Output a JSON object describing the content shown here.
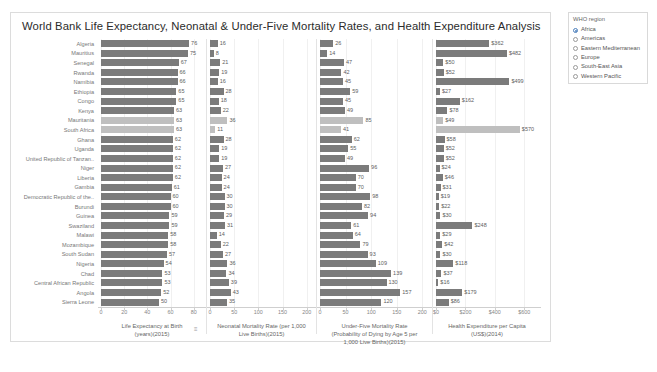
{
  "dashboard": {
    "title": "World Bank Life Expectancy, Neonatal & Under-Five Mortality Rates, and Health Expenditure Analysis"
  },
  "legend": {
    "title": "WHO region",
    "items": [
      {
        "label": "Africa",
        "selected": true
      },
      {
        "label": "Americas",
        "selected": false
      },
      {
        "label": "Eastern Mediterranean",
        "selected": false
      },
      {
        "label": "Europe",
        "selected": false
      },
      {
        "label": "South-East Asia",
        "selected": false
      },
      {
        "label": "Western Pacific",
        "selected": false
      }
    ]
  },
  "countries": [
    "Algeria",
    "Mauritius",
    "Senegal",
    "Rwanda",
    "Namibia",
    "Ethiopia",
    "Congo",
    "Kenya",
    "Mauritania",
    "South Africa",
    "Ghana",
    "Uganda",
    "United Republic of Tanzan..",
    "Niger",
    "Liberia",
    "Gambia",
    "Democratic Republic of the..",
    "Burundi",
    "Guinea",
    "Swaziland",
    "Malawi",
    "Mozambique",
    "South Sudan",
    "Nigeria",
    "Chad",
    "Central African Republic",
    "Angola",
    "Sierra Leone"
  ],
  "highlighted_rows": [
    8,
    9
  ],
  "chart_data": [
    {
      "type": "bar",
      "orientation": "horizontal",
      "title": "Life Expectancy at Birth (years)(2015)",
      "xlabel": "Life Expectancy at Birth (years)(2015)",
      "caption_lines": [
        "Life Expectancy at Birth",
        "(years)(2015)"
      ],
      "ylabel": "",
      "categories": [
        "Algeria",
        "Mauritius",
        "Senegal",
        "Rwanda",
        "Namibia",
        "Ethiopia",
        "Congo",
        "Kenya",
        "Mauritania",
        "South Africa",
        "Ghana",
        "Uganda",
        "United Republic of Tanzan..",
        "Niger",
        "Liberia",
        "Gambia",
        "Democratic Republic of the..",
        "Burundi",
        "Guinea",
        "Swaziland",
        "Malawi",
        "Mozambique",
        "South Sudan",
        "Nigeria",
        "Chad",
        "Central African Republic",
        "Angola",
        "Sierra Leone"
      ],
      "values": [
        76,
        75,
        67,
        66,
        66,
        65,
        65,
        63,
        63,
        63,
        62,
        62,
        62,
        62,
        62,
        61,
        60,
        60,
        59,
        59,
        58,
        58,
        57,
        54,
        53,
        53,
        52,
        50
      ],
      "ticks": [
        0,
        20,
        40,
        60,
        80
      ],
      "tick_labels": [
        "0",
        "20",
        "40",
        "60",
        "80"
      ],
      "xlim": [
        0,
        88
      ],
      "grid": true
    },
    {
      "type": "bar",
      "orientation": "horizontal",
      "title": "Neonatal Mortality Rate (per 1,000 Live Births)(2015)",
      "xlabel": "Neonatal Mortality Rate (per 1,000 Live Births)(2015)",
      "caption_lines": [
        "Neonatal Mortality Rate (per 1,000",
        "Live Births)(2015)"
      ],
      "ylabel": "",
      "categories": [
        "Algeria",
        "Mauritius",
        "Senegal",
        "Rwanda",
        "Namibia",
        "Ethiopia",
        "Congo",
        "Kenya",
        "Mauritania",
        "South Africa",
        "Ghana",
        "Uganda",
        "United Republic of Tanzan..",
        "Niger",
        "Liberia",
        "Gambia",
        "Democratic Republic of the..",
        "Burundi",
        "Guinea",
        "Swaziland",
        "Malawi",
        "Mozambique",
        "South Sudan",
        "Nigeria",
        "Chad",
        "Central African Republic",
        "Angola",
        "Sierra Leone"
      ],
      "values": [
        16,
        8,
        21,
        19,
        16,
        28,
        18,
        22,
        36,
        11,
        28,
        19,
        19,
        27,
        24,
        24,
        30,
        30,
        29,
        31,
        14,
        22,
        27,
        36,
        34,
        39,
        43,
        35
      ],
      "ticks": [
        0,
        50,
        100,
        150,
        200
      ],
      "tick_labels": [
        "0",
        "50",
        "100",
        "150",
        "200"
      ],
      "xlim": [
        0,
        215
      ],
      "grid": true
    },
    {
      "type": "bar",
      "orientation": "horizontal",
      "title": "Under-Five Mortality Rate (Probability of Dying by Age 5 per 1,000 Live Births)(2015)",
      "xlabel": "Under-Five Mortality Rate (Probability of Dying by Age 5 per 1,000 Live Births)(2015)",
      "caption_lines": [
        "Under-Five Mortality Rate",
        "(Probability of Dying by Age 5 per",
        "1,000 Live Births)(2015)"
      ],
      "ylabel": "",
      "categories": [
        "Algeria",
        "Mauritius",
        "Senegal",
        "Rwanda",
        "Namibia",
        "Ethiopia",
        "Congo",
        "Kenya",
        "Mauritania",
        "South Africa",
        "Ghana",
        "Uganda",
        "United Republic of Tanzan..",
        "Niger",
        "Liberia",
        "Gambia",
        "Democratic Republic of the..",
        "Burundi",
        "Guinea",
        "Swaziland",
        "Malawi",
        "Mozambique",
        "South Sudan",
        "Nigeria",
        "Chad",
        "Central African Republic",
        "Angola",
        "Sierra Leone"
      ],
      "values": [
        26,
        14,
        47,
        42,
        45,
        59,
        45,
        49,
        85,
        41,
        62,
        55,
        49,
        96,
        70,
        70,
        98,
        82,
        94,
        61,
        64,
        79,
        93,
        109,
        139,
        130,
        157,
        120
      ],
      "ticks": [
        0,
        50,
        100,
        150,
        200
      ],
      "tick_labels": [
        "0",
        "50",
        "100",
        "150",
        "200"
      ],
      "xlim": [
        0,
        215
      ],
      "grid": true
    },
    {
      "type": "bar",
      "orientation": "horizontal",
      "title": "Health Expenditure per Capita (US$)(2014)",
      "xlabel": "Health Expenditure per Capita (US$)(2014)",
      "caption_lines": [
        "Health Expenditure per Capita",
        "(US$)(2014)"
      ],
      "ylabel": "",
      "categories": [
        "Algeria",
        "Mauritius",
        "Senegal",
        "Rwanda",
        "Namibia",
        "Ethiopia",
        "Congo",
        "Kenya",
        "Mauritania",
        "South Africa",
        "Ghana",
        "Uganda",
        "United Republic of Tanzan..",
        "Niger",
        "Liberia",
        "Gambia",
        "Democratic Republic of the..",
        "Burundi",
        "Guinea",
        "Swaziland",
        "Malawi",
        "Mozambique",
        "South Sudan",
        "Nigeria",
        "Chad",
        "Central African Republic",
        "Angola",
        "Sierra Leone"
      ],
      "values": [
        362,
        482,
        50,
        52,
        499,
        27,
        162,
        78,
        49,
        570,
        58,
        52,
        52,
        24,
        46,
        31,
        19,
        22,
        30,
        248,
        29,
        42,
        30,
        118,
        37,
        16,
        179,
        86
      ],
      "value_labels": [
        "$362",
        "$482",
        "$50",
        "$52",
        "$499",
        "$27",
        "$162",
        "$78",
        "$49",
        "$570",
        "$58",
        "$52",
        "$52",
        "$24",
        "$46",
        "$31",
        "$19",
        "$22",
        "$30",
        "$248",
        "$29",
        "$42",
        "$30",
        "$118",
        "$37",
        "$16",
        "$179",
        "$86"
      ],
      "ticks": [
        0,
        200,
        400,
        600
      ],
      "tick_labels": [
        "$0",
        "$200",
        "$400",
        "$600"
      ],
      "xlim": [
        0,
        700
      ],
      "grid": true
    }
  ],
  "colors": {
    "bar": "#7b7b7b",
    "bar_highlight": "#bfbfbf",
    "accent": "#4a7ebb",
    "grid": "#f0f0f0",
    "axis": "#cfcfcf",
    "text": "#5e5e5e"
  }
}
